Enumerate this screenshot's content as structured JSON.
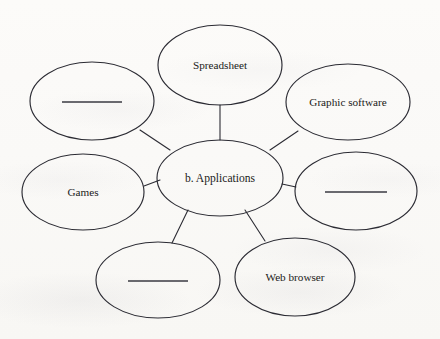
{
  "diagram": {
    "type": "concept-map",
    "title_label": "b. Applications",
    "stroke_color": "#2b2b33",
    "blank_line_color": "#3a3a42",
    "background_color": "#fbfaf8",
    "text_color": "#1b1b20",
    "center": {
      "name": "center-node",
      "label": "b. Applications",
      "cx": 220,
      "cy": 178,
      "rx": 63,
      "ry": 38,
      "is_blank": false
    },
    "nodes": [
      {
        "name": "node-spreadsheet",
        "label": "Spreadsheet",
        "cx": 220,
        "cy": 65,
        "rx": 62,
        "ry": 40,
        "is_blank": false
      },
      {
        "name": "node-blank-top-left",
        "label": "",
        "cx": 92,
        "cy": 101,
        "rx": 62,
        "ry": 39,
        "is_blank": true,
        "blank_line_width": 60
      },
      {
        "name": "node-graphic-software",
        "label": "Graphic software",
        "cx": 348,
        "cy": 102,
        "rx": 62,
        "ry": 38,
        "is_blank": false
      },
      {
        "name": "node-games",
        "label": "Games",
        "cx": 83,
        "cy": 192,
        "rx": 61,
        "ry": 38,
        "is_blank": false
      },
      {
        "name": "node-blank-right",
        "label": "",
        "cx": 356,
        "cy": 191,
        "rx": 61,
        "ry": 39,
        "is_blank": true,
        "blank_line_width": 62
      },
      {
        "name": "node-blank-bottom-left",
        "label": "",
        "cx": 158,
        "cy": 280,
        "rx": 62,
        "ry": 38,
        "is_blank": true,
        "blank_line_width": 60
      },
      {
        "name": "node-web-browser",
        "label": "Web browser",
        "cx": 295,
        "cy": 277,
        "rx": 60,
        "ry": 39,
        "is_blank": false
      }
    ],
    "connectors": [
      {
        "name": "connector-center-spreadsheet",
        "x1": 220,
        "y1": 140,
        "x2": 220,
        "y2": 105
      },
      {
        "name": "connector-center-blank-top-left",
        "x1": 170,
        "y1": 150,
        "x2": 140,
        "y2": 130
      },
      {
        "name": "connector-center-graphic-software",
        "x1": 270,
        "y1": 150,
        "x2": 298,
        "y2": 131
      },
      {
        "name": "connector-center-games",
        "x1": 160,
        "y1": 180,
        "x2": 144,
        "y2": 186
      },
      {
        "name": "connector-center-blank-right",
        "x1": 282,
        "y1": 184,
        "x2": 296,
        "y2": 187
      },
      {
        "name": "connector-center-blank-bottom-left",
        "x1": 188,
        "y1": 210,
        "x2": 172,
        "y2": 243
      },
      {
        "name": "connector-center-web-browser",
        "x1": 245,
        "y1": 210,
        "x2": 265,
        "y2": 241
      }
    ]
  }
}
